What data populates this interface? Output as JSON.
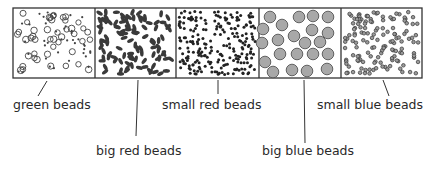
{
  "diagram": {
    "panels": [
      {
        "id": "green",
        "label": "green beads",
        "description": "mix of small open circles and tiny dots"
      },
      {
        "id": "big-red",
        "label": "big red beads",
        "description": "dark oval elongated beads"
      },
      {
        "id": "small-red",
        "label": "small red beads",
        "description": "dense small black dots"
      },
      {
        "id": "big-blue",
        "label": "big blue beads",
        "description": "large gray filled circles"
      },
      {
        "id": "small-blue",
        "label": "small blue beads",
        "description": "small gray ringed dots"
      }
    ],
    "labels": {
      "green": "green beads",
      "big_red": "big red beads",
      "small_red": "small red beads",
      "big_blue": "big blue beads",
      "small_blue": "small blue beads"
    },
    "colors": {
      "border": "#333333",
      "dark_bead": "#3a3a3a",
      "big_blue_fill": "#a8a8a8",
      "small_blue_fill": "#9a9a9a"
    }
  }
}
